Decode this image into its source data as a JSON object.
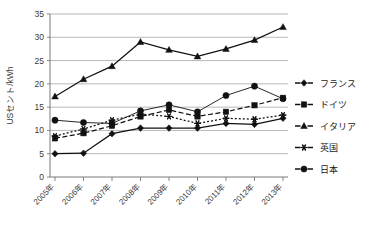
{
  "chart_data": {
    "type": "line",
    "title": "",
    "subtitle": "",
    "xlabel": "",
    "ylabel": "USセント/kWh",
    "categories": [
      "2005年",
      "2006年",
      "2007年",
      "2008年",
      "2009年",
      "2010年",
      "2011年",
      "2012年",
      "2013年"
    ],
    "ylim": [
      0,
      35
    ],
    "yticks": [
      0,
      5,
      10,
      15,
      20,
      25,
      30,
      35
    ],
    "grid": true,
    "legend_position": "right",
    "series": [
      {
        "name": "フランス",
        "marker": "diamond",
        "dash": "solid",
        "color": "#111111",
        "values": [
          5.0,
          5.1,
          9.3,
          10.5,
          10.5,
          10.5,
          11.5,
          11.3,
          12.6
        ]
      },
      {
        "name": "ドイツ",
        "marker": "square",
        "dash": "dashed",
        "color": "#111111",
        "values": [
          8.3,
          9.4,
          11.0,
          13.0,
          14.4,
          13.0,
          14.0,
          15.4,
          17.0
        ]
      },
      {
        "name": "イタリア",
        "marker": "triangle",
        "dash": "solid",
        "color": "#111111",
        "values": [
          17.3,
          21.0,
          23.8,
          29.0,
          27.3,
          25.9,
          27.5,
          29.4,
          32.2
        ]
      },
      {
        "name": "英国",
        "marker": "asterisk",
        "dash": "dotted",
        "color": "#111111",
        "values": [
          8.8,
          10.3,
          12.2,
          13.5,
          13.0,
          11.5,
          12.6,
          12.4,
          13.3
        ]
      },
      {
        "name": "日本",
        "marker": "circle",
        "dash": "solid",
        "color": "#111111",
        "values": [
          12.2,
          11.7,
          11.5,
          14.2,
          15.5,
          14.0,
          17.5,
          19.5,
          16.8
        ]
      }
    ]
  },
  "legend": {
    "items": [
      {
        "label": "フランス"
      },
      {
        "label": "ドイツ"
      },
      {
        "label": "イタリア"
      },
      {
        "label": "英国"
      },
      {
        "label": "日本"
      }
    ]
  },
  "axes": {
    "y_axis_title": "USセント/kWh",
    "y_tick_labels": [
      "35",
      "30",
      "25",
      "20",
      "15",
      "10",
      "5",
      "0"
    ],
    "x_tick_labels": [
      "2005年",
      "2006年",
      "2007年",
      "2008年",
      "2009年",
      "2010年",
      "2011年",
      "2012年",
      "2013年"
    ]
  },
  "colors": {
    "ink": "#111111",
    "grid": "#9a9a9a",
    "axis": "#6b6b6b",
    "background": "#ffffff"
  }
}
